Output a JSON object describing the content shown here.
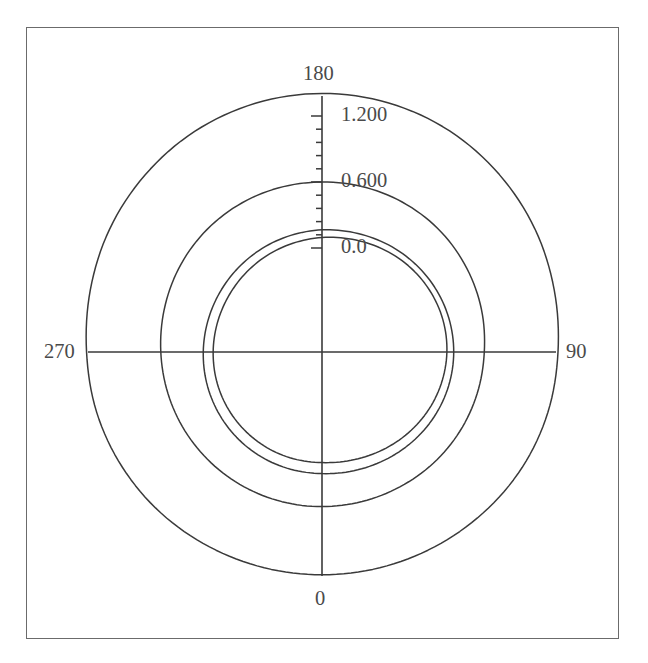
{
  "figure": {
    "kind": "polar-plot",
    "background_color": "#ffffff",
    "frame_color": "#6b6b6b",
    "line_color": "#3a3a3a"
  },
  "angular_axis": {
    "labels": [
      "0",
      "90",
      "180",
      "270"
    ],
    "label_0": "0",
    "label_90": "90",
    "label_180": "180",
    "label_270": "270",
    "units": "degrees",
    "zero_position": "bottom",
    "direction": "clockwise"
  },
  "radial_axis": {
    "tick_labels": [
      "0.0",
      "0.600",
      "1.200"
    ],
    "tick_0": "0.0",
    "tick_1": "0.600",
    "tick_2": "1.200",
    "along_direction_deg": 180,
    "minor_ticks_per_interval": 5
  },
  "chart_data": {
    "type": "line",
    "subtype": "polar",
    "title": "",
    "xlabel": "",
    "ylabel": "",
    "grid": false,
    "legend": null,
    "theta_zero_location": "bottom",
    "theta_direction": "clockwise",
    "rlim": [
      0.0,
      1.5
    ],
    "rticks": [
      0.0,
      0.6,
      1.2
    ],
    "thetaticks": [
      0,
      90,
      180,
      270
    ],
    "theta_deg": [
      0,
      15,
      30,
      45,
      60,
      75,
      90,
      105,
      120,
      135,
      150,
      165,
      180,
      195,
      210,
      225,
      240,
      255,
      270,
      285,
      300,
      315,
      330,
      345,
      360
    ],
    "series": [
      {
        "name": "outer-curve",
        "values": [
          1.08,
          1.085,
          1.1,
          1.125,
          1.155,
          1.18,
          1.2,
          1.24,
          1.29,
          1.335,
          1.375,
          1.398,
          1.405,
          1.395,
          1.37,
          1.33,
          1.285,
          1.235,
          1.195,
          1.175,
          1.15,
          1.125,
          1.1,
          1.085,
          1.08
        ]
      },
      {
        "name": "mid-curve",
        "values": [
          0.46,
          0.462,
          0.47,
          0.485,
          0.5,
          0.515,
          0.53,
          0.555,
          0.575,
          0.592,
          0.6,
          0.602,
          0.6,
          0.598,
          0.592,
          0.58,
          0.562,
          0.54,
          0.52,
          0.505,
          0.492,
          0.48,
          0.47,
          0.463,
          0.46
        ]
      },
      {
        "name": "inner-curve-a",
        "values": [
          0.16,
          0.172,
          0.19,
          0.212,
          0.232,
          0.246,
          0.252,
          0.248,
          0.236,
          0.218,
          0.198,
          0.178,
          0.165,
          0.152,
          0.142,
          0.134,
          0.13,
          0.13,
          0.134,
          0.14,
          0.146,
          0.152,
          0.156,
          0.158,
          0.16
        ]
      },
      {
        "name": "inner-curve-b",
        "values": [
          0.06,
          0.074,
          0.098,
          0.126,
          0.154,
          0.176,
          0.19,
          0.192,
          0.182,
          0.164,
          0.14,
          0.115,
          0.095,
          0.078,
          0.064,
          0.052,
          0.044,
          0.042,
          0.044,
          0.048,
          0.052,
          0.055,
          0.058,
          0.059,
          0.06
        ]
      }
    ]
  }
}
